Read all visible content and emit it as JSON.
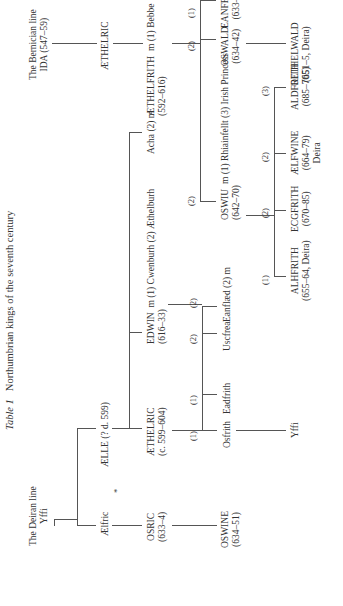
{
  "title": {
    "label": "Table 1",
    "text": "Northumbrian kings of the seventh century"
  },
  "deiran": {
    "heading": "The Deiran line",
    "yffi": "Yffi",
    "aelfric": "Ælfric",
    "aelle": "ÆLLE (? d. 599)",
    "osric": {
      "name": "OSRIC",
      "dates": "(633–4)"
    },
    "aethelric": {
      "name": "ÆTHELRIC",
      "dates": "(c. 599–604)"
    },
    "edwin": {
      "name": "EDWIN",
      "dates": "(616–33)",
      "marriage": "m (1) Cwenburh (2) Æthelburh"
    },
    "acha": "Acha (2) m",
    "oswine": {
      "name": "OSWINE",
      "dates": "(634–51)"
    },
    "osfrith": "Osfrith",
    "eadfrith": "Eadfrith",
    "uscfrea": "Uscfrea",
    "eanflaed": "Eanflæd (2) m",
    "yffi2": "Yffi"
  },
  "bernician": {
    "heading": "The Bernician line",
    "ida": "IDA (547–59)",
    "aethelric": "ÆTHELRIC",
    "aethelfrith": {
      "name": "ÆTHELFRITH",
      "dates": "(592–616)",
      "marriage": "m (1) Bebbe"
    },
    "oswald": {
      "name": "OSWALD",
      "dates": "(634–42)"
    },
    "eanfrith": {
      "name": "EANFRITH",
      "dates": "(633–4)"
    },
    "oethelwald": {
      "name": "OETHELWALD",
      "dates": "(651–5, Deira)"
    },
    "oswiu": {
      "name": "OSWIU",
      "dates": "(642–70)",
      "marriage": "m (1) Rhiainfellt (3) Irish Princess"
    },
    "alhfrith": {
      "name": "ALHFRITH",
      "dates": "(655–64, Deira)"
    },
    "ecgfrith": {
      "name": "ECGFRITH",
      "dates": "(670–85)"
    },
    "aelfwine": {
      "name": "ÆLFWINE",
      "dates": "(664–79)",
      "note": "Deira"
    },
    "aldfrith": {
      "name": "ALDFRITH",
      "dates": "(685–705)"
    }
  },
  "markers": {
    "one": "(1)",
    "two": "(2)",
    "three": "(3)",
    "asterisk": "*"
  }
}
